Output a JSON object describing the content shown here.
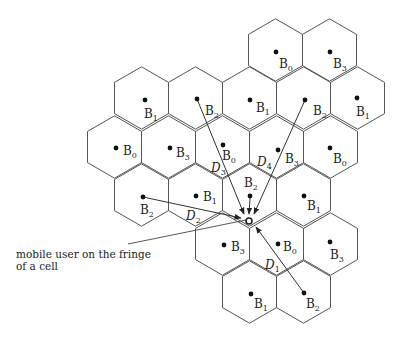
{
  "figure": {
    "type": "hexagonal cellular network reuse pattern",
    "annotation": {
      "line1": "mobile user on the fringe",
      "line2": "of a cell"
    },
    "hex_radius": 31.2,
    "cells": [
      {
        "cx": 275.5,
        "cy": 50,
        "station": "B",
        "sub": "0"
      },
      {
        "cx": 329.5,
        "cy": 50,
        "station": "B",
        "sub": "3"
      },
      {
        "cx": 141.5,
        "cy": 98,
        "station": "B",
        "sub": "1"
      },
      {
        "cx": 195.5,
        "cy": 98,
        "station": "B",
        "sub": "2"
      },
      {
        "cx": 249.5,
        "cy": 98,
        "station": "B",
        "sub": "1"
      },
      {
        "cx": 303.5,
        "cy": 98,
        "station": "B",
        "sub": "2"
      },
      {
        "cx": 357.5,
        "cy": 98,
        "station": "B",
        "sub": "1"
      },
      {
        "cx": 114.5,
        "cy": 147,
        "station": "B",
        "sub": "0"
      },
      {
        "cx": 168.5,
        "cy": 147,
        "station": "B",
        "sub": "3"
      },
      {
        "cx": 222.5,
        "cy": 147,
        "station": "B",
        "sub": "0"
      },
      {
        "cx": 276.5,
        "cy": 147,
        "station": "B",
        "sub": "3"
      },
      {
        "cx": 330.5,
        "cy": 147,
        "station": "B",
        "sub": "0"
      },
      {
        "cx": 141.5,
        "cy": 195,
        "station": "B",
        "sub": "2"
      },
      {
        "cx": 195.5,
        "cy": 195,
        "station": "B",
        "sub": "1"
      },
      {
        "cx": 249.5,
        "cy": 195,
        "station": "B",
        "sub": "2"
      },
      {
        "cx": 303.5,
        "cy": 195,
        "station": "B",
        "sub": "1"
      },
      {
        "cx": 222.5,
        "cy": 244,
        "station": "B",
        "sub": "3"
      },
      {
        "cx": 276.5,
        "cy": 244,
        "station": "B",
        "sub": "0"
      },
      {
        "cx": 330.5,
        "cy": 244,
        "station": "B",
        "sub": "3"
      },
      {
        "cx": 249.5,
        "cy": 292,
        "station": "B",
        "sub": "1"
      },
      {
        "cx": 303.5,
        "cy": 292,
        "station": "B",
        "sub": "2"
      }
    ],
    "base_stations": [
      {
        "x": 276,
        "y": 52,
        "lx": 279,
        "ly": 68,
        "label": "B",
        "sub": "0"
      },
      {
        "x": 330,
        "y": 52,
        "lx": 333,
        "ly": 68,
        "label": "B",
        "sub": "3"
      },
      {
        "x": 145,
        "y": 100,
        "lx": 144,
        "ly": 118,
        "label": "B",
        "sub": "1"
      },
      {
        "x": 197,
        "y": 99,
        "lx": 205,
        "ly": 115,
        "label": "B",
        "sub": "2"
      },
      {
        "x": 250,
        "y": 100,
        "lx": 256,
        "ly": 112,
        "label": "B",
        "sub": "1"
      },
      {
        "x": 305,
        "y": 100,
        "lx": 313,
        "ly": 115,
        "label": "B",
        "sub": "2"
      },
      {
        "x": 357,
        "y": 98,
        "lx": 356,
        "ly": 116,
        "label": "B",
        "sub": "1"
      },
      {
        "x": 116,
        "y": 148,
        "lx": 123,
        "ly": 155,
        "label": "B",
        "sub": "0"
      },
      {
        "x": 170,
        "y": 148,
        "lx": 176,
        "ly": 157,
        "label": "B",
        "sub": "3"
      },
      {
        "x": 223,
        "y": 145,
        "lx": 222,
        "ly": 160,
        "label": "B",
        "sub": "0"
      },
      {
        "x": 278,
        "y": 150,
        "lx": 285,
        "ly": 163,
        "label": "B",
        "sub": "3"
      },
      {
        "x": 330,
        "y": 148,
        "lx": 333,
        "ly": 163,
        "label": "B",
        "sub": "0"
      },
      {
        "x": 143,
        "y": 197,
        "lx": 140,
        "ly": 214,
        "label": "B",
        "sub": "2"
      },
      {
        "x": 196,
        "y": 196,
        "lx": 203,
        "ly": 201,
        "label": "B",
        "sub": "1"
      },
      {
        "x": 250,
        "y": 196,
        "lx": 244,
        "ly": 187,
        "label": "B",
        "sub": "2"
      },
      {
        "x": 304,
        "y": 196,
        "lx": 307,
        "ly": 210,
        "label": "B",
        "sub": "1"
      },
      {
        "x": 224,
        "y": 245,
        "lx": 231,
        "ly": 251,
        "label": "B",
        "sub": "3"
      },
      {
        "x": 278,
        "y": 244,
        "lx": 283,
        "ly": 251,
        "label": "B",
        "sub": "0"
      },
      {
        "x": 330,
        "y": 242,
        "lx": 330,
        "ly": 259,
        "label": "B",
        "sub": "3"
      },
      {
        "x": 251,
        "y": 294,
        "lx": 254,
        "ly": 308,
        "label": "B",
        "sub": "1"
      },
      {
        "x": 304,
        "y": 293,
        "lx": 306,
        "ly": 308,
        "label": "B",
        "sub": "2"
      }
    ],
    "mobile_user": {
      "x": 249,
      "y": 221,
      "r": 3
    },
    "distance_arrows": [
      {
        "name": "D3",
        "x1": 197,
        "y1": 99,
        "x2": 244,
        "y2": 214,
        "label": "D",
        "sub": "3",
        "lx": 211,
        "ly": 172
      },
      {
        "name": "D4",
        "x1": 305,
        "y1": 100,
        "x2": 254,
        "y2": 214,
        "label": "D",
        "sub": "4",
        "lx": 257,
        "ly": 166
      },
      {
        "name": "D2",
        "x1": 143,
        "y1": 197,
        "x2": 241,
        "y2": 218,
        "label": "D",
        "sub": "2",
        "lx": 186,
        "ly": 220
      },
      {
        "name": "D0",
        "x1": 250,
        "y1": 198,
        "x2": 249,
        "y2": 214,
        "label": "",
        "sub": "",
        "lx": 0,
        "ly": 0
      },
      {
        "name": "D1",
        "x1": 304,
        "y1": 293,
        "x2": 256,
        "y2": 227,
        "label": "D",
        "sub": "1",
        "lx": 265,
        "ly": 269
      }
    ],
    "leader_line": {
      "x1": 128,
      "y1": 244,
      "x2": 246,
      "y2": 220
    }
  }
}
